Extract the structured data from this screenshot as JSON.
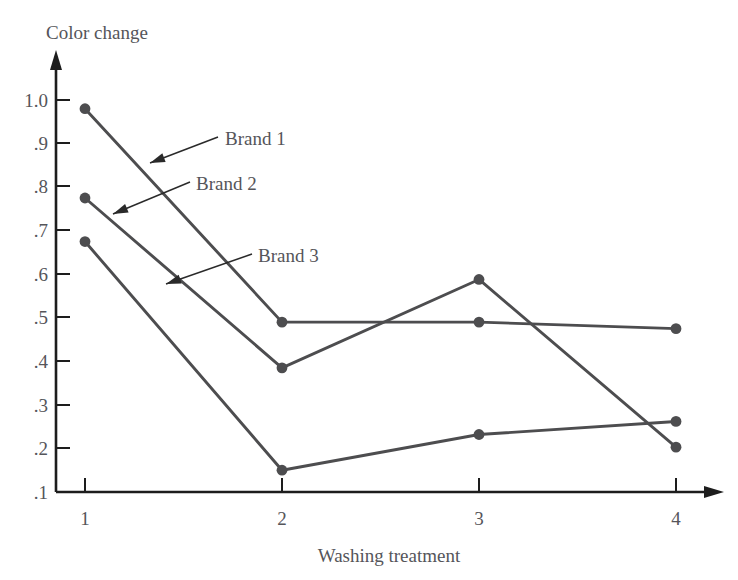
{
  "chart_data": {
    "type": "line",
    "title": "",
    "xlabel": "Washing treatment",
    "ylabel": "Color change",
    "x": [
      1,
      2,
      3,
      4
    ],
    "categories": [
      "1",
      "2",
      "3",
      "4"
    ],
    "xtick_labels": [
      "1",
      "2",
      "3",
      "4"
    ],
    "ytick_labels": [
      "1.0",
      ".9",
      ".8",
      ".7",
      ".6",
      ".5",
      ".4",
      ".3",
      ".2",
      ".1"
    ],
    "ytick_values": [
      1.0,
      0.9,
      0.8,
      0.7,
      0.6,
      0.5,
      0.4,
      0.3,
      0.2,
      0.1
    ],
    "xlim": [
      1,
      4
    ],
    "ylim": [
      0.1,
      1.0
    ],
    "grid": false,
    "legend_position": "inline-annotations",
    "series": [
      {
        "name": "Brand 1",
        "values": [
          0.98,
          0.49,
          0.49,
          0.475
        ],
        "color": "#4d4d4f",
        "marker": "circle"
      },
      {
        "name": "Brand 2",
        "values": [
          0.775,
          0.385,
          0.588,
          0.203
        ],
        "color": "#4d4d4f",
        "marker": "circle"
      },
      {
        "name": "Brand 3",
        "values": [
          0.675,
          0.15,
          0.232,
          0.262
        ],
        "color": "#4d4d4f",
        "marker": "circle"
      }
    ],
    "annotations": [
      {
        "text": "Brand 1",
        "label_x": 225,
        "label_y": 145,
        "tip_x": 150,
        "tip_y": 163,
        "tail_x": 218,
        "tail_y": 137
      },
      {
        "text": "Brand 2",
        "label_x": 196,
        "label_y": 190,
        "tip_x": 113,
        "tip_y": 214,
        "tail_x": 190,
        "tail_y": 182
      },
      {
        "text": "Brand 3",
        "label_x": 258,
        "label_y": 262,
        "tip_x": 166,
        "tip_y": 284,
        "tail_x": 252,
        "tail_y": 254
      }
    ],
    "axis_color": "#1d1d1d",
    "text_color": "#55555a"
  }
}
